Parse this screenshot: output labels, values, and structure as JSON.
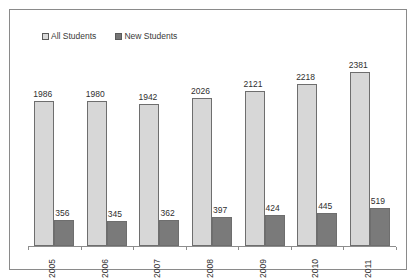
{
  "chart_data": {
    "type": "bar",
    "title": "",
    "xlabel": "",
    "ylabel": "",
    "grid": false,
    "legend_position": "top-left",
    "ylim": [
      0,
      2600
    ],
    "categories": [
      "2005",
      "2006",
      "2007",
      "2008",
      "2009",
      "2010",
      "2011"
    ],
    "series": [
      {
        "name": "All Students",
        "color": "#d7d7d7",
        "values": [
          1986,
          1980,
          1942,
          2026,
          2121,
          2218,
          2381
        ]
      },
      {
        "name": "New Students",
        "color": "#7a7a7a",
        "values": [
          356,
          345,
          362,
          397,
          424,
          445,
          519
        ]
      }
    ]
  },
  "legend": {
    "entries": [
      {
        "label": "All Students",
        "icon": "square-swatch-light"
      },
      {
        "label": "New Students",
        "icon": "square-swatch-dark"
      }
    ]
  }
}
